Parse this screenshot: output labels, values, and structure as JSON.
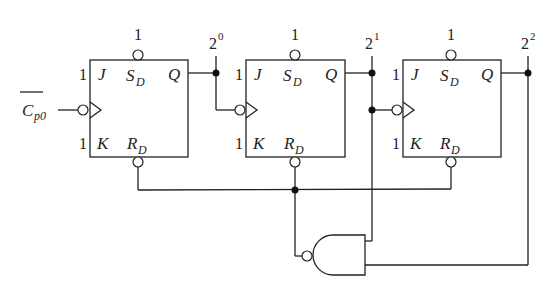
{
  "diagram": {
    "type": "circuit",
    "clock_input": {
      "base": "C",
      "subscript": "p0",
      "overbar": true
    },
    "flip_flops": [
      {
        "id": "FF0",
        "J": "1",
        "K": "1",
        "SD": "1",
        "pins": {
          "J": "J",
          "K": "K",
          "SD": "S",
          "SD_sub": "D",
          "RD": "R",
          "RD_sub": "D",
          "Q": "Q"
        },
        "output_label": {
          "base": "2",
          "exp": "0"
        }
      },
      {
        "id": "FF1",
        "J": "1",
        "K": "1",
        "SD": "1",
        "pins": {
          "J": "J",
          "K": "K",
          "SD": "S",
          "SD_sub": "D",
          "RD": "R",
          "RD_sub": "D",
          "Q": "Q"
        },
        "output_label": {
          "base": "2",
          "exp": "1"
        }
      },
      {
        "id": "FF2",
        "J": "1",
        "K": "1",
        "SD": "1",
        "pins": {
          "J": "J",
          "K": "K",
          "SD": "S",
          "SD_sub": "D",
          "RD": "R",
          "RD_sub": "D",
          "Q": "Q"
        },
        "output_label": {
          "base": "2",
          "exp": "2"
        }
      }
    ],
    "gate": {
      "type": "NAND",
      "inputs": [
        "Q1 (2^1)",
        "Q2 (2^2)"
      ],
      "output": "RD bus (all flip-flops)"
    }
  }
}
